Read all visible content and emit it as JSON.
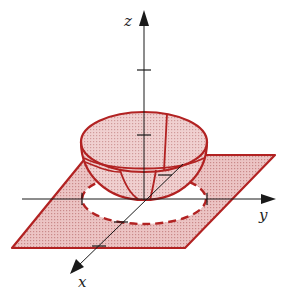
{
  "figure": {
    "type": "3d-surface-diagram",
    "axes": {
      "z": {
        "label": "z"
      },
      "y": {
        "label": "y"
      },
      "x": {
        "label": "x"
      }
    },
    "colors": {
      "surface_stroke": "#b22222",
      "surface_fill": "#e8b9b9",
      "plane_fill": "#e6b3b3",
      "axis": "#1a1a1a",
      "background": "#ffffff"
    },
    "elements": [
      "hemisphere-surface",
      "xy-plane-parallelogram",
      "dashed-projection-circle",
      "z-axis",
      "y-axis",
      "x-axis"
    ]
  }
}
